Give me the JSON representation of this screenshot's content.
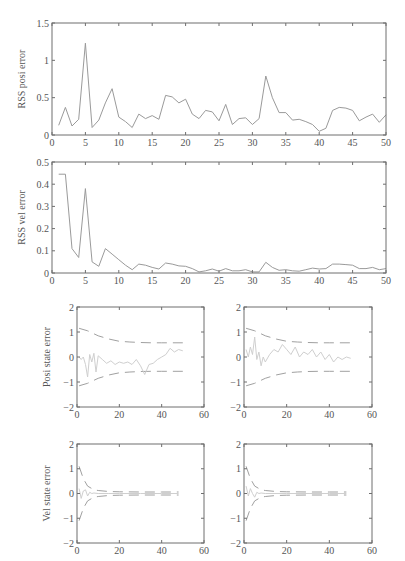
{
  "chart_data": [
    {
      "id": "rss-posi",
      "type": "line",
      "title": "",
      "xlabel": "",
      "ylabel": "RSS posi error",
      "xlim": [
        0,
        50
      ],
      "ylim": [
        0,
        1.5
      ],
      "xticks": [
        0,
        5,
        10,
        15,
        20,
        25,
        30,
        35,
        40,
        45,
        50
      ],
      "yticks": [
        0,
        0.5,
        1,
        1.5
      ],
      "ytick_labels": [
        "0",
        "0.5",
        "1",
        "1.5"
      ],
      "grid": false,
      "series": [
        {
          "name": "RSS posi error",
          "x": [
            1,
            2,
            3,
            4,
            5,
            6,
            7,
            8,
            9,
            10,
            11,
            12,
            13,
            14,
            15,
            16,
            17,
            18,
            19,
            20,
            21,
            22,
            23,
            24,
            25,
            26,
            27,
            28,
            29,
            30,
            31,
            32,
            33,
            34,
            35,
            36,
            37,
            38,
            39,
            40,
            41,
            42,
            43,
            44,
            45,
            46,
            47,
            48,
            49,
            50
          ],
          "values": [
            0.13,
            0.37,
            0.12,
            0.21,
            1.23,
            0.1,
            0.2,
            0.43,
            0.62,
            0.24,
            0.18,
            0.1,
            0.28,
            0.22,
            0.26,
            0.21,
            0.53,
            0.51,
            0.43,
            0.48,
            0.28,
            0.22,
            0.33,
            0.31,
            0.19,
            0.41,
            0.14,
            0.22,
            0.23,
            0.14,
            0.22,
            0.79,
            0.5,
            0.3,
            0.3,
            0.2,
            0.21,
            0.18,
            0.14,
            0.05,
            0.09,
            0.33,
            0.37,
            0.36,
            0.33,
            0.19,
            0.24,
            0.28,
            0.17,
            0.27
          ]
        }
      ]
    },
    {
      "id": "rss-vel",
      "type": "line",
      "title": "",
      "xlabel": "",
      "ylabel": "RSS vel error",
      "xlim": [
        0,
        50
      ],
      "ylim": [
        0,
        0.5
      ],
      "xticks": [
        0,
        5,
        10,
        15,
        20,
        25,
        30,
        35,
        40,
        45,
        50
      ],
      "yticks": [
        0,
        0.1,
        0.2,
        0.3,
        0.4,
        0.5
      ],
      "ytick_labels": [
        "0",
        "0.1",
        "0.2",
        "0.3",
        "0.4",
        "0.5"
      ],
      "grid": false,
      "series": [
        {
          "name": "RSS vel error",
          "x": [
            1,
            2,
            3,
            4,
            5,
            6,
            7,
            8,
            9,
            10,
            11,
            12,
            13,
            14,
            15,
            16,
            17,
            18,
            19,
            20,
            21,
            22,
            23,
            24,
            25,
            26,
            27,
            28,
            29,
            30,
            31,
            32,
            33,
            34,
            35,
            36,
            37,
            38,
            39,
            40,
            41,
            42,
            43,
            44,
            45,
            46,
            47,
            48,
            49,
            50
          ],
          "values": [
            0.445,
            0.445,
            0.11,
            0.07,
            0.38,
            0.05,
            0.03,
            0.11,
            0.085,
            0.06,
            0.035,
            0.015,
            0.04,
            0.035,
            0.025,
            0.018,
            0.045,
            0.04,
            0.032,
            0.03,
            0.02,
            0.005,
            0.01,
            0.018,
            0.008,
            0.02,
            0.01,
            0.01,
            0.015,
            0.005,
            0.005,
            0.048,
            0.025,
            0.012,
            0.015,
            0.01,
            0.008,
            0.015,
            0.022,
            0.018,
            0.02,
            0.04,
            0.04,
            0.038,
            0.035,
            0.02,
            0.02,
            0.025,
            0.015,
            0.02
          ]
        }
      ]
    },
    {
      "id": "posi-state-1",
      "type": "line",
      "ylabel": "Posi state error",
      "xlim": [
        0,
        60
      ],
      "ylim": [
        -2,
        2
      ],
      "xticks": [
        0,
        20,
        40,
        60
      ],
      "yticks": [
        -2,
        -1,
        0,
        1,
        2
      ],
      "ytick_labels": [
        "−2",
        "−1",
        "0",
        "1",
        "2"
      ],
      "series": [
        {
          "name": "upper bound (dashed)",
          "x": [
            1,
            5,
            10,
            15,
            20,
            25,
            30,
            35,
            40,
            45,
            50
          ],
          "values": [
            1.15,
            1.05,
            0.85,
            0.72,
            0.63,
            0.6,
            0.58,
            0.57,
            0.57,
            0.57,
            0.57
          ]
        },
        {
          "name": "lower bound (dashed)",
          "x": [
            1,
            5,
            10,
            15,
            20,
            25,
            30,
            35,
            40,
            45,
            50
          ],
          "values": [
            -1.15,
            -1.05,
            -0.85,
            -0.72,
            -0.63,
            -0.6,
            -0.58,
            -0.57,
            -0.57,
            -0.57,
            -0.57
          ]
        },
        {
          "name": "state error",
          "x": [
            1,
            2,
            3,
            4,
            5,
            6,
            7,
            8,
            9,
            10,
            12,
            14,
            16,
            18,
            20,
            22,
            24,
            26,
            28,
            30,
            32,
            34,
            36,
            38,
            40,
            42,
            44,
            46,
            48,
            50
          ],
          "values": [
            0.0,
            -0.1,
            0.0,
            -0.3,
            -0.8,
            0.1,
            -0.2,
            0.15,
            -0.6,
            0.05,
            -0.1,
            -0.25,
            -0.15,
            -0.3,
            -0.2,
            -0.25,
            -0.2,
            -0.3,
            -0.1,
            -0.35,
            -0.7,
            -0.3,
            -0.25,
            -0.1,
            0.0,
            0.1,
            0.35,
            0.2,
            0.3,
            0.25
          ]
        }
      ]
    },
    {
      "id": "posi-state-2",
      "type": "line",
      "ylabel": "",
      "xlim": [
        0,
        60
      ],
      "ylim": [
        -2,
        2
      ],
      "xticks": [
        0,
        20,
        40,
        60
      ],
      "yticks": [
        -2,
        -1,
        0,
        1,
        2
      ],
      "ytick_labels": [
        "−2",
        "−1",
        "0",
        "1",
        "2"
      ],
      "series": [
        {
          "name": "upper bound (dashed)",
          "x": [
            1,
            5,
            10,
            15,
            20,
            25,
            30,
            35,
            40,
            45,
            50
          ],
          "values": [
            1.15,
            1.05,
            0.85,
            0.72,
            0.63,
            0.6,
            0.58,
            0.57,
            0.57,
            0.57,
            0.57
          ]
        },
        {
          "name": "lower bound (dashed)",
          "x": [
            1,
            5,
            10,
            15,
            20,
            25,
            30,
            35,
            40,
            45,
            50
          ],
          "values": [
            -1.15,
            -1.05,
            -0.85,
            -0.72,
            -0.63,
            -0.6,
            -0.58,
            -0.57,
            -0.57,
            -0.57,
            -0.57
          ]
        },
        {
          "name": "state error",
          "x": [
            1,
            2,
            3,
            4,
            5,
            6,
            7,
            8,
            9,
            10,
            12,
            14,
            16,
            18,
            20,
            22,
            24,
            26,
            28,
            30,
            32,
            34,
            36,
            38,
            40,
            42,
            44,
            46,
            48,
            50
          ],
          "values": [
            0.3,
            0.0,
            0.4,
            0.1,
            0.8,
            -0.1,
            0.2,
            -0.35,
            0.0,
            -0.2,
            0.1,
            0.3,
            0.2,
            0.5,
            0.3,
            0.1,
            0.4,
            0.0,
            0.2,
            0.1,
            0.3,
            0.0,
            0.2,
            -0.1,
            0.1,
            -0.2,
            0.0,
            -0.1,
            0.0,
            -0.05
          ]
        }
      ]
    },
    {
      "id": "vel-state-1",
      "type": "line",
      "ylabel": "Vel state error",
      "xlim": [
        0,
        60
      ],
      "ylim": [
        -2,
        2
      ],
      "xticks": [
        0,
        20,
        40,
        60
      ],
      "yticks": [
        -2,
        -1,
        0,
        1,
        2
      ],
      "ytick_labels": [
        "−2",
        "−1",
        "0",
        "1",
        "2"
      ],
      "series": [
        {
          "name": "upper bound (dashed)",
          "x": [
            1,
            3,
            5,
            8,
            10,
            15,
            20,
            30,
            40,
            48
          ],
          "values": [
            1.1,
            0.6,
            0.3,
            0.15,
            0.12,
            0.08,
            0.07,
            0.06,
            0.06,
            0.06
          ]
        },
        {
          "name": "lower bound (dashed)",
          "x": [
            1,
            3,
            5,
            8,
            10,
            15,
            20,
            30,
            40,
            48
          ],
          "values": [
            -1.1,
            -0.6,
            -0.3,
            -0.15,
            -0.12,
            -0.08,
            -0.07,
            -0.06,
            -0.06,
            -0.06
          ]
        },
        {
          "name": "state error",
          "x": [
            1,
            2,
            3,
            4,
            5,
            6,
            7,
            8,
            10,
            15,
            20,
            30,
            40,
            48
          ],
          "values": [
            0.2,
            -0.2,
            0.1,
            0.15,
            -0.1,
            0.05,
            0.0,
            0.02,
            0.0,
            0.0,
            0.0,
            0.0,
            0.0,
            0.0
          ]
        }
      ]
    },
    {
      "id": "vel-state-2",
      "type": "line",
      "ylabel": "",
      "xlim": [
        0,
        60
      ],
      "ylim": [
        -2,
        2
      ],
      "xticks": [
        0,
        20,
        40,
        60
      ],
      "yticks": [
        -2,
        -1,
        0,
        1,
        2
      ],
      "ytick_labels": [
        "−2",
        "−1",
        "0",
        "1",
        "2"
      ],
      "series": [
        {
          "name": "upper bound (dashed)",
          "x": [
            1,
            3,
            5,
            8,
            10,
            15,
            20,
            30,
            40,
            48
          ],
          "values": [
            1.1,
            0.6,
            0.3,
            0.15,
            0.12,
            0.08,
            0.07,
            0.06,
            0.06,
            0.06
          ]
        },
        {
          "name": "lower bound (dashed)",
          "x": [
            1,
            3,
            5,
            8,
            10,
            15,
            20,
            30,
            40,
            48
          ],
          "values": [
            -1.1,
            -0.6,
            -0.3,
            -0.15,
            -0.12,
            -0.08,
            -0.07,
            -0.06,
            -0.06,
            -0.06
          ]
        },
        {
          "name": "state error",
          "x": [
            1,
            2,
            3,
            4,
            5,
            6,
            7,
            8,
            10,
            15,
            20,
            30,
            40,
            48
          ],
          "values": [
            0.3,
            -0.1,
            0.2,
            0.0,
            -0.15,
            0.05,
            0.0,
            0.02,
            0.0,
            0.0,
            0.0,
            0.0,
            0.0,
            0.0
          ]
        }
      ]
    }
  ],
  "colors": {
    "frame": "#6e6e6e",
    "series_line": "#9a9a9a",
    "bound_dashed": "#a0a0a0",
    "state_error": "#cfcfcf",
    "text": "#555555"
  },
  "layout": [
    {
      "left": 52,
      "top": 23,
      "right": 386,
      "bottom": 135
    },
    {
      "left": 52,
      "top": 162,
      "right": 386,
      "bottom": 273
    },
    {
      "left": 77,
      "top": 307,
      "right": 204,
      "bottom": 407
    },
    {
      "left": 244,
      "top": 307,
      "right": 372,
      "bottom": 407
    },
    {
      "left": 77,
      "top": 444,
      "right": 204,
      "bottom": 543
    },
    {
      "left": 244,
      "top": 444,
      "right": 372,
      "bottom": 543
    }
  ]
}
